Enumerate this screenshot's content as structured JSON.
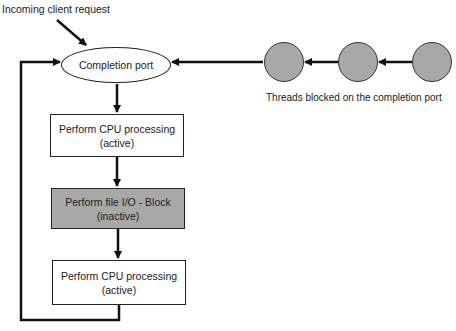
{
  "diagram": {
    "incoming_label": "Incoming client request",
    "completion_port_label": "Completion port",
    "threads_label": "Threads blocked on the completion port",
    "thread_count": 3,
    "steps": [
      {
        "line1": "Perform CPU processing",
        "line2": "(active)",
        "state": "active"
      },
      {
        "line1": "Perform file I/O - Block",
        "line2": "(inactive)",
        "state": "inactive"
      },
      {
        "line1": "Perform CPU processing",
        "line2": "(active)",
        "state": "active"
      }
    ],
    "colors": {
      "active_fill": "#ffffff",
      "inactive_fill": "#a8a8a8",
      "thread_fill": "#a8a8a8",
      "stroke": "#222222"
    }
  }
}
